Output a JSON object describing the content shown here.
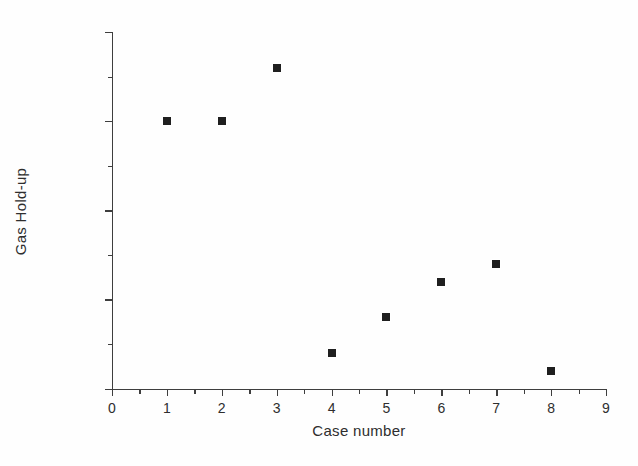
{
  "figure": {
    "background_color": "#fefefe",
    "marker_color": "#1c1c1c",
    "axis_color": "#3b3b3b"
  },
  "chart_data": {
    "type": "scatter",
    "title": "",
    "subtitle": "",
    "xlabel": "Case number",
    "ylabel": "Gas Hold-up",
    "xlim": [
      0,
      9
    ],
    "ylim": [
      0.005,
      0.007
    ],
    "grid": false,
    "legend": null,
    "x_major_ticks": [
      0,
      1,
      2,
      3,
      4,
      5,
      6,
      7,
      8,
      9
    ],
    "x_tick_labels": [
      "0",
      "1",
      "2",
      "3",
      "4",
      "5",
      "6",
      "7",
      "8",
      "9"
    ],
    "x_minor_ticks": [
      0.5,
      1.5,
      2.5,
      3.5,
      4.5,
      5.5,
      6.5,
      7.5,
      8.5
    ],
    "y_major_ticks": [
      0.005,
      0.0055,
      0.006,
      0.0065,
      0.007
    ],
    "y_tick_labels": [
      "0.0050",
      "0.0055",
      "0.0060",
      "0.0065",
      "0.0070"
    ],
    "y_minor_ticks": [
      0.00525,
      0.00575,
      0.00625,
      0.00675
    ],
    "marker_style": "filled-square",
    "series": [
      {
        "name": "Gas Hold-up",
        "x": [
          1,
          2,
          3,
          4,
          5,
          6,
          7,
          8
        ],
        "values": [
          0.0065,
          0.0065,
          0.0068,
          0.0052,
          0.0054,
          0.0056,
          0.0057,
          0.0051
        ]
      }
    ],
    "points": [
      {
        "case": "1",
        "gas_holdup": "0.0065"
      },
      {
        "case": "2",
        "gas_holdup": "0.0065"
      },
      {
        "case": "3",
        "gas_holdup": "0.0068"
      },
      {
        "case": "4",
        "gas_holdup": "0.0052"
      },
      {
        "case": "5",
        "gas_holdup": "0.0054"
      },
      {
        "case": "6",
        "gas_holdup": "0.0056"
      },
      {
        "case": "7",
        "gas_holdup": "0.0057"
      },
      {
        "case": "8",
        "gas_holdup": "0.0051"
      }
    ]
  }
}
